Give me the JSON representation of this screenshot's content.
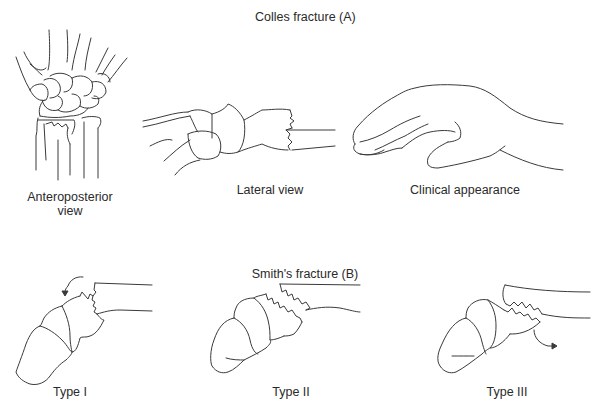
{
  "diagram": {
    "sections": [
      {
        "title": "Colles fracture (A)",
        "panels": [
          {
            "id": "ap",
            "label_line1": "Anteroposterior",
            "label_line2": "view"
          },
          {
            "id": "lateral",
            "label": "Lateral view"
          },
          {
            "id": "clinical",
            "label": "Clinical appearance"
          }
        ]
      },
      {
        "title": "Smith's fracture (B)",
        "panels": [
          {
            "id": "type1",
            "label": "Type I"
          },
          {
            "id": "type2",
            "label": "Type II"
          },
          {
            "id": "type3",
            "label": "Type III"
          }
        ]
      }
    ],
    "colors": {
      "line": "#3a3a3a",
      "text": "#2a2a2a",
      "background": "#ffffff"
    }
  }
}
